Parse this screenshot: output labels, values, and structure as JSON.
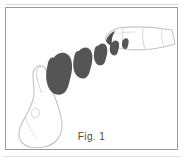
{
  "figure": {
    "caption": "Fig. 1",
    "frame": {
      "border_color": "#9a9a9a",
      "background_color": "#ffffff"
    },
    "ink": {
      "solid_fill_color": "#555555",
      "outline_stroke_color": "#bdbdbd",
      "caption_color": "#4a4a4a"
    },
    "elements": {
      "foot_outline": {
        "name": "foot-outline",
        "description": "outline drawing of a foot with big toe, lower-left"
      },
      "finger_outline": {
        "name": "finger-outline",
        "description": "outline drawing of a pointing finger, upper-right"
      },
      "impression_label": "footprint-impression"
    },
    "impressions": [
      {
        "id": 1,
        "label": "impression-1",
        "cx": 57,
        "cy": 70,
        "size": 28,
        "rotation": -18
      },
      {
        "id": 2,
        "label": "impression-2",
        "cx": 79,
        "cy": 58,
        "size": 21,
        "rotation": -18
      },
      {
        "id": 3,
        "label": "impression-3",
        "cx": 96,
        "cy": 50,
        "size": 15,
        "rotation": -18
      },
      {
        "id": 4,
        "label": "impression-4",
        "cx": 109,
        "cy": 45,
        "size": 11,
        "rotation": -18
      },
      {
        "id": 5,
        "label": "impression-5",
        "cx": 120,
        "cy": 41,
        "size": 8,
        "rotation": -18
      }
    ],
    "rules": {
      "top_rule_color": "#d8d8d8",
      "bottom_rule_color": "#e2e2e2"
    }
  }
}
